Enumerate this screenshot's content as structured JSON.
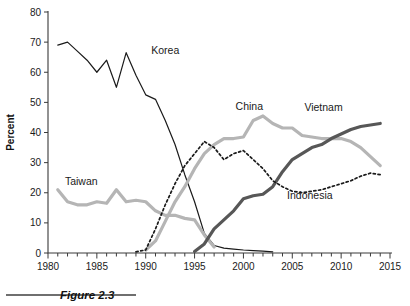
{
  "figure": {
    "caption": "Figure 2.3",
    "caption_rule": "horizontal-rule"
  },
  "chart_data": {
    "type": "line",
    "title": "",
    "xlabel": "",
    "ylabel": "Percent",
    "xlim": [
      1980,
      2015
    ],
    "ylim": [
      0,
      80
    ],
    "grid": false,
    "legend_position": "inline-labels",
    "xticks": [
      1980,
      1985,
      1990,
      1995,
      2000,
      2005,
      2010,
      2015
    ],
    "xtick_labels": [
      "1980",
      "1985",
      "1990",
      "1995",
      "2000",
      "2005",
      "2010",
      "2015"
    ],
    "xminor_tick_step": 1,
    "yticks": [
      0,
      10,
      20,
      30,
      40,
      50,
      60,
      70,
      80
    ],
    "ytick_labels": [
      "0",
      "10",
      "20",
      "30",
      "40",
      "50",
      "60",
      "70",
      "80"
    ],
    "x": [
      1981,
      1982,
      1983,
      1984,
      1985,
      1986,
      1987,
      1988,
      1989,
      1990,
      1991,
      1992,
      1993,
      1994,
      1995,
      1996,
      1997,
      1998,
      1999,
      2000,
      2001,
      2002,
      2003,
      2004,
      2005,
      2006,
      2007,
      2008,
      2009,
      2010,
      2011,
      2012,
      2013,
      2014
    ],
    "series": [
      {
        "name": "Korea",
        "color": "#1a1a1a",
        "style": "solid",
        "width": 1.2,
        "label_x": 1992,
        "label_y": 66,
        "x": [
          1981,
          1982,
          1983,
          1984,
          1985,
          1986,
          1987,
          1988,
          1989,
          1990,
          1991,
          1992,
          1993,
          1994,
          1995,
          1996,
          1997,
          1998,
          1999,
          2000,
          2001,
          2002,
          2003
        ],
        "values": [
          69,
          70,
          67,
          64,
          60,
          64,
          55,
          66.5,
          59,
          52.5,
          51,
          44,
          36,
          26,
          17,
          6.5,
          2.5,
          1.6,
          1.3,
          1,
          0.8,
          0.6,
          0.4
        ]
      },
      {
        "name": "Taiwan",
        "color": "#b5b5b5",
        "style": "solid",
        "width": 3.2,
        "label_x": 1983.4,
        "label_y": 22.5,
        "x": [
          1981,
          1982,
          1983,
          1984,
          1985,
          1986,
          1987,
          1988,
          1989,
          1990,
          1991,
          1992,
          1993,
          1994,
          1995,
          1996,
          1997
        ],
        "values": [
          21,
          17,
          16,
          16,
          17,
          16.5,
          21,
          17,
          17.5,
          17,
          14,
          12.5,
          12.5,
          11.5,
          11,
          6,
          2
        ]
      },
      {
        "name": "China",
        "color": "#b5b5b5",
        "style": "solid",
        "width": 3.2,
        "label_x": 2000.6,
        "label_y": 47.5,
        "x": [
          1990,
          1991,
          1992,
          1993,
          1994,
          1995,
          1996,
          1997,
          1998,
          1999,
          2000,
          2001,
          2002,
          2003,
          2004,
          2005,
          2006,
          2007,
          2008,
          2009,
          2010,
          2011,
          2012,
          2013,
          2014
        ],
        "values": [
          1,
          4,
          10.5,
          17,
          22,
          28,
          33,
          36,
          38,
          38,
          38.5,
          44,
          45.5,
          43,
          41.5,
          41.5,
          39,
          38.5,
          38,
          38,
          38,
          37,
          35,
          32,
          29
        ]
      },
      {
        "name": "Vietnam",
        "color": "#575757",
        "style": "solid",
        "width": 3.2,
        "label_x": 2008.2,
        "label_y": 47,
        "x": [
          1995,
          1996,
          1997,
          1998,
          1999,
          2000,
          2001,
          2002,
          2003,
          2004,
          2005,
          2006,
          2007,
          2008,
          2009,
          2010,
          2011,
          2012,
          2013,
          2014
        ],
        "values": [
          0.5,
          3,
          8,
          11,
          14,
          18,
          19,
          19.5,
          22,
          27,
          31,
          33,
          35,
          36,
          38,
          39.5,
          41,
          42,
          42.5,
          43
        ]
      },
      {
        "name": "Indonesia",
        "color": "#1a1a1a",
        "style": "dotted",
        "width": 1.7,
        "label_x": 2006.8,
        "label_y": 18,
        "x": [
          1989,
          1990,
          1991,
          1992,
          1993,
          1994,
          1995,
          1996,
          1997,
          1998,
          1999,
          2000,
          2001,
          2002,
          2003,
          2004,
          2005,
          2006,
          2007,
          2008,
          2009,
          2010,
          2011,
          2012,
          2013,
          2014
        ],
        "values": [
          0.4,
          1,
          8,
          16,
          23,
          29,
          33,
          37,
          35,
          31,
          33,
          34,
          31,
          28,
          24,
          22,
          20.5,
          20,
          20.5,
          21,
          22,
          23,
          24,
          25.5,
          26.5,
          26
        ]
      }
    ]
  }
}
